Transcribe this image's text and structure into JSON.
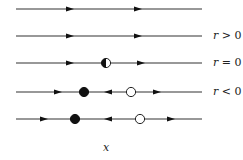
{
  "diagram": {
    "type": "phase-line bifurcation diagram",
    "x_axis_label": "x",
    "labels": [
      {
        "row": 1,
        "text": "r > 0",
        "var": "r",
        "op": ">",
        "val": "0"
      },
      {
        "row": 2,
        "text": "r = 0",
        "var": "r",
        "op": "=",
        "val": "0"
      },
      {
        "row": 3,
        "text": "r < 0",
        "var": "r",
        "op": "<",
        "val": "0"
      }
    ],
    "rows": [
      {
        "y": 9,
        "arrows": [
          {
            "x": 70,
            "dir": "right"
          },
          {
            "x": 138,
            "dir": "right"
          }
        ],
        "points": []
      },
      {
        "y": 36,
        "arrows": [
          {
            "x": 70,
            "dir": "right"
          },
          {
            "x": 138,
            "dir": "right"
          }
        ],
        "points": []
      },
      {
        "y": 63,
        "arrows": [
          {
            "x": 70,
            "dir": "right"
          },
          {
            "x": 141,
            "dir": "right"
          }
        ],
        "points": [
          {
            "x": 106,
            "type": "half-stable"
          }
        ]
      },
      {
        "y": 92,
        "arrows": [
          {
            "x": 58,
            "dir": "right"
          },
          {
            "x": 108,
            "dir": "left"
          },
          {
            "x": 157,
            "dir": "right"
          }
        ],
        "points": [
          {
            "x": 84,
            "type": "stable"
          },
          {
            "x": 131,
            "type": "unstable"
          }
        ]
      },
      {
        "y": 119,
        "arrows": [
          {
            "x": 44,
            "dir": "right"
          },
          {
            "x": 108,
            "dir": "left"
          },
          {
            "x": 171,
            "dir": "right"
          }
        ],
        "points": [
          {
            "x": 75,
            "type": "stable"
          },
          {
            "x": 140,
            "type": "unstable"
          }
        ]
      }
    ],
    "line_x_start": 16,
    "line_x_end": 202,
    "colors": {
      "line": "#333333",
      "fill": "#111111",
      "open": "#ffffff"
    }
  }
}
